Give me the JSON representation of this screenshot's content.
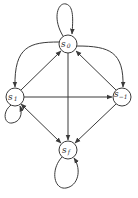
{
  "diagram": {
    "type": "state-transition-graph",
    "nodes": [
      {
        "id": "s0",
        "base": "s",
        "sub": "0",
        "cx": 68,
        "cy": 44,
        "r": 9
      },
      {
        "id": "s1",
        "base": "s",
        "sub": "1",
        "cx": 15,
        "cy": 97,
        "r": 9
      },
      {
        "id": "sm1",
        "base": "s",
        "sub": "−1",
        "cx": 122,
        "cy": 97,
        "r": 9
      },
      {
        "id": "sf",
        "base": "s",
        "sub": "f",
        "cx": 68,
        "cy": 150,
        "r": 9
      }
    ],
    "edges": [
      {
        "from": "s0",
        "to": "s0",
        "kind": "self-loop"
      },
      {
        "from": "s0",
        "to": "s1",
        "kind": "curved"
      },
      {
        "from": "s0",
        "to": "sm1",
        "kind": "curved"
      },
      {
        "from": "s1",
        "to": "s0",
        "kind": "straight"
      },
      {
        "from": "sm1",
        "to": "s0",
        "kind": "straight"
      },
      {
        "from": "s0",
        "to": "sf",
        "kind": "straight"
      },
      {
        "from": "s1",
        "to": "sm1",
        "kind": "straight"
      },
      {
        "from": "s1",
        "to": "s1",
        "kind": "self-loop"
      },
      {
        "from": "s1",
        "to": "sf",
        "kind": "straight"
      },
      {
        "from": "sf",
        "to": "s1",
        "kind": "straight"
      },
      {
        "from": "sm1",
        "to": "sf",
        "kind": "straight"
      },
      {
        "from": "sf",
        "to": "sf",
        "kind": "self-loop"
      }
    ],
    "colors": {
      "stroke": "#3a3a3a",
      "background": "#ffffff"
    }
  }
}
